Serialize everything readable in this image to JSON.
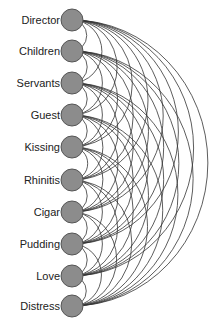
{
  "diagram": {
    "type": "arc-diagram",
    "nodes": [
      {
        "label": "Director",
        "y": 20
      },
      {
        "label": "Children",
        "y": 51
      },
      {
        "label": "Servants",
        "y": 83
      },
      {
        "label": "Guest",
        "y": 115
      },
      {
        "label": "Kissing",
        "y": 147
      },
      {
        "label": "Rhinitis",
        "y": 180
      },
      {
        "label": "Cigar",
        "y": 212
      },
      {
        "label": "Pudding",
        "y": 244
      },
      {
        "label": "Love",
        "y": 276
      },
      {
        "label": "Distress",
        "y": 306
      }
    ],
    "edges": "all-pairs",
    "node_color": "#8c8c8c",
    "node_stroke": "#555555",
    "edge_color": "#333333"
  }
}
